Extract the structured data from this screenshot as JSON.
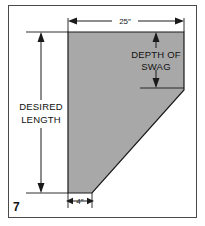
{
  "figure": {
    "number": "7",
    "frame_color": "#4a4a4a",
    "background_color": "#ffffff",
    "line_color": "#1a1a1a"
  },
  "shape": {
    "name": "swag-pattern-piece",
    "fill_color": "#a8a8a8",
    "stroke_color": "#1a1a1a",
    "description": "Pentagon pattern piece with diagonal cut from right edge to bottom left"
  },
  "dimensions": {
    "top_width": {
      "label": "25″",
      "name": "top-width-dimension"
    },
    "bottom_width": {
      "label": "4″",
      "name": "bottom-width-dimension"
    }
  },
  "labels": {
    "desired_length": {
      "line1": "DESIRED",
      "line2": "LENGTH"
    },
    "depth_of_swag": {
      "line1": "DEPTH OF",
      "line2": "SWAG"
    }
  }
}
